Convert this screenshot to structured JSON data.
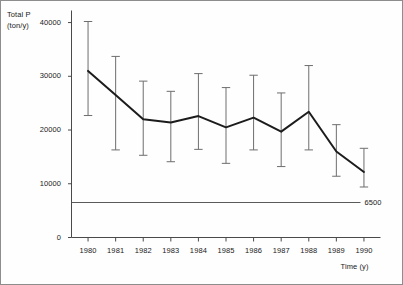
{
  "figure": {
    "y_axis_title_line1": "Total P",
    "y_axis_title_line2": "(ton/y)",
    "x_axis_title": "Time (y)",
    "origin_label": "0",
    "reference_label": "6500"
  },
  "chart_data": {
    "type": "line",
    "title": "",
    "subtitle": "",
    "xlabel": "Time (y)",
    "ylabel": "Total P (ton/y)",
    "x": [
      1980,
      1981,
      1982,
      1983,
      1984,
      1985,
      1986,
      1987,
      1988,
      1989,
      1990
    ],
    "categories": [
      "1980",
      "1981",
      "1982",
      "1983",
      "1984",
      "1985",
      "1986",
      "1987",
      "1988",
      "1989",
      "1990"
    ],
    "series": [
      {
        "name": "Total P",
        "values": [
          31000,
          26500,
          22000,
          21400,
          22600,
          20500,
          22300,
          19700,
          23400,
          16000,
          12200
        ],
        "err_low": [
          22700,
          16300,
          15300,
          14100,
          16400,
          13800,
          16300,
          13200,
          16300,
          11400,
          9400
        ],
        "err_high": [
          40200,
          33700,
          29100,
          27200,
          30500,
          27900,
          30200,
          26900,
          32000,
          21000,
          16600
        ]
      }
    ],
    "reference_lines": [
      {
        "label": "6500",
        "value": 6500,
        "orientation": "horizontal"
      }
    ],
    "xlim": [
      1979.4,
      1990.6
    ],
    "ylim": [
      0,
      41500
    ],
    "yticks": [
      0,
      10000,
      20000,
      30000,
      40000
    ],
    "ytick_labels": [
      "0",
      "10000",
      "20000",
      "30000",
      "40000"
    ],
    "xticks": [
      1980,
      1981,
      1982,
      1983,
      1984,
      1985,
      1986,
      1987,
      1988,
      1989,
      1990
    ],
    "grid": false,
    "legend": "none",
    "error_bars": true
  }
}
